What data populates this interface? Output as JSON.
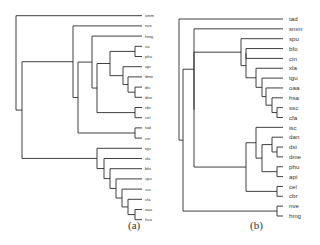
{
  "figure": {
    "panels": [
      {
        "id": "a",
        "caption": "(a)",
        "caption_pos": [
          128,
          227
        ],
        "leaf_x": 142,
        "label_x": 145,
        "label_size": 4.2,
        "y0": 15.7,
        "dy": 10.2,
        "leaves": [
          "smm",
          "nve",
          "hmg",
          "isc",
          "phu",
          "api",
          "dme",
          "dsi",
          "dan",
          "cbr",
          "cel",
          "tad",
          "cin",
          "tgu",
          "xla",
          "bfo",
          "spu",
          "ssc",
          "cfa",
          "oaa",
          "hsa"
        ],
        "tree": {
          "x": 16,
          "c": [
            {
              "leaf": "smm"
            },
            {
              "x": 22,
              "c": [
                {
                  "x": 73,
                  "c": [
                    {
                      "leaf": "nve"
                    },
                    {
                      "x": 78,
                      "c": [
                        {
                          "x": 92,
                          "c": [
                            {
                              "leaf": "hmg"
                            },
                            {
                              "x": 97,
                              "c": [
                                {
                                  "x": 110,
                                  "c": [
                                    {
                                      "x": 135,
                                      "c": [
                                        {
                                          "leaf": "isc"
                                        },
                                        {
                                          "leaf": "phu"
                                        }
                                      ]
                                    },
                                    {
                                      "x": 123,
                                      "c": [
                                        {
                                          "leaf": "api"
                                        },
                                        {
                                          "x": 128,
                                          "c": [
                                            {
                                              "leaf": "dme"
                                            },
                                            {
                                              "x": 135,
                                              "c": [
                                                {
                                                  "leaf": "dsi"
                                                },
                                                {
                                                  "leaf": "dan"
                                                }
                                              ]
                                            }
                                          ]
                                        }
                                      ]
                                    }
                                  ]
                                },
                                {
                                  "x": 135,
                                  "c": [
                                    {
                                      "leaf": "cbr"
                                    },
                                    {
                                      "leaf": "cel"
                                    }
                                  ]
                                }
                              ]
                            }
                          ]
                        },
                        {
                          "x": 135,
                          "c": [
                            {
                              "leaf": "tad"
                            },
                            {
                              "leaf": "cin"
                            }
                          ]
                        }
                      ]
                    }
                  ]
                },
                {
                  "x": 97,
                  "c": [
                    {
                      "leaf": "tgu"
                    },
                    {
                      "x": 104,
                      "c": [
                        {
                          "leaf": "xla"
                        },
                        {
                          "x": 110,
                          "c": [
                            {
                              "leaf": "bfo"
                            },
                            {
                              "x": 116,
                              "c": [
                                {
                                  "leaf": "spu"
                                },
                                {
                                  "x": 122,
                                  "c": [
                                    {
                                      "leaf": "ssc"
                                    },
                                    {
                                      "x": 128,
                                      "c": [
                                        {
                                          "leaf": "cfa"
                                        },
                                        {
                                          "x": 135,
                                          "c": [
                                            {
                                              "leaf": "oaa"
                                            },
                                            {
                                              "leaf": "hsa"
                                            }
                                          ]
                                        }
                                      ]
                                    }
                                  ]
                                }
                              ]
                            }
                          ]
                        }
                      ]
                    }
                  ]
                }
              ]
            }
          ]
        }
      },
      {
        "id": "b",
        "caption": "(b)",
        "caption_pos": [
          250,
          227
        ],
        "leaf_x": 283,
        "label_x": 289,
        "label_size": 6.2,
        "y0": 19,
        "dy": 9.85,
        "leaves": [
          "tad",
          "smm",
          "spu",
          "bfo",
          "cin",
          "xla",
          "tgu",
          "oaa",
          "hsa",
          "ssc",
          "cfa",
          "isc",
          "dan",
          "dsi",
          "dme",
          "phu",
          "api",
          "cel",
          "cbr",
          "nve",
          "hmg"
        ],
        "tree": {
          "x": 179,
          "c": [
            {
              "leaf": "tad"
            },
            {
              "x": 183,
              "c": [
                {
                  "x": 194,
                  "c": [
                    {
                      "leaf": "smm"
                    },
                    {
                      "x": 194,
                      "c": [
                        {
                          "x": 241,
                          "c": [
                            {
                              "leaf": "spu"
                            },
                            {
                              "x": 246,
                              "c": [
                                {
                                  "x": 246,
                                  "c": [
                                    {
                                      "leaf": "bfo"
                                    },
                                    {
                                      "leaf": "cin"
                                    }
                                  ]
                                },
                                {
                                  "x": 256,
                                  "c": [
                                    {
                                      "leaf": "xla"
                                    },
                                    {
                                      "x": 262,
                                      "c": [
                                        {
                                          "leaf": "tgu"
                                        },
                                        {
                                          "x": 266,
                                          "c": [
                                            {
                                              "leaf": "oaa"
                                            },
                                            {
                                              "x": 272,
                                              "c": [
                                                {
                                                  "leaf": "hsa"
                                                },
                                                {
                                                  "x": 277,
                                                  "c": [
                                                    {
                                                      "leaf": "ssc"
                                                    },
                                                    {
                                                      "leaf": "cfa"
                                                    }
                                                  ]
                                                }
                                              ]
                                            }
                                          ]
                                        }
                                      ]
                                    }
                                  ]
                                }
                              ]
                            }
                          ]
                        },
                        {
                          "x": 246,
                          "c": [
                            {
                              "x": 256,
                              "c": [
                                {
                                  "leaf": "isc"
                                },
                                {
                                  "x": 262,
                                  "c": [
                                    {
                                      "x": 272,
                                      "c": [
                                        {
                                          "leaf": "dan"
                                        },
                                        {
                                          "x": 277,
                                          "c": [
                                            {
                                              "leaf": "dsi"
                                            },
                                            {
                                              "leaf": "dme"
                                            }
                                          ]
                                        }
                                      ]
                                    },
                                    {
                                      "x": 277,
                                      "c": [
                                        {
                                          "leaf": "phu"
                                        },
                                        {
                                          "leaf": "api"
                                        }
                                      ]
                                    }
                                  ]
                                }
                              ]
                            },
                            {
                              "x": 277,
                              "c": [
                                {
                                  "leaf": "cel"
                                },
                                {
                                  "leaf": "cbr"
                                }
                              ]
                            }
                          ]
                        }
                      ]
                    }
                  ]
                },
                {
                  "x": 277,
                  "c": [
                    {
                      "leaf": "nve"
                    },
                    {
                      "leaf": "hmg"
                    }
                  ]
                }
              ]
            }
          ]
        }
      }
    ]
  }
}
